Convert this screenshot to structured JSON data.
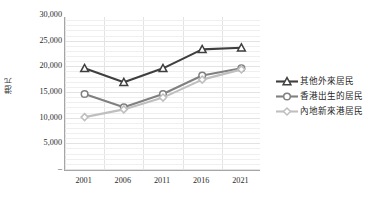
{
  "chart_data": {
    "type": "line",
    "title": "",
    "subtitle": "",
    "xlabel": "",
    "ylabel": "港元",
    "categories": [
      "2001",
      "2006",
      "2011",
      "2016",
      "2021"
    ],
    "ylim": [
      0,
      30000
    ],
    "ytick_labels": [
      "–",
      "5,000",
      "10,000",
      "15,000",
      "20,000",
      "25,000",
      "30,000"
    ],
    "ytick_values": [
      0,
      5000,
      10000,
      15000,
      20000,
      25000,
      30000
    ],
    "grid": true,
    "minor_grid": true,
    "minor_grid_divisions": 5,
    "legend_position": "right",
    "series": [
      {
        "name": "其他外來居民",
        "values": [
          20000,
          17300,
          20000,
          23700,
          24000
        ],
        "color": "#3f3f3f",
        "marker": "triangle"
      },
      {
        "name": "香港出生的居民",
        "values": [
          15000,
          12400,
          15000,
          18600,
          20000
        ],
        "color": "#808080",
        "marker": "circle"
      },
      {
        "name": "內地新來港居民",
        "values": [
          10500,
          12000,
          14300,
          17800,
          19800
        ],
        "color": "#bfbfbf",
        "marker": "diamond"
      }
    ]
  },
  "legend": {
    "items": [
      {
        "label": "其他外來居民"
      },
      {
        "label": "香港出生的居民"
      },
      {
        "label": "內地新來港居民"
      }
    ]
  }
}
